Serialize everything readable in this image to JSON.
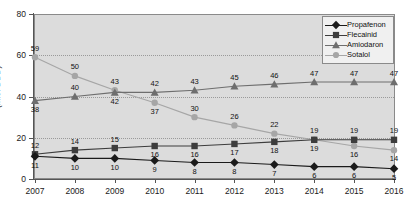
{
  "chart_data": {
    "type": "line",
    "title": "",
    "xlabel": "",
    "ylabel": "(Mio. DDD)",
    "categories": [
      "2007",
      "2008",
      "2009",
      "2010",
      "2011",
      "2012",
      "2013",
      "2014",
      "2015",
      "2016"
    ],
    "ylim": [
      0,
      80
    ],
    "yticks": [
      0,
      20,
      40,
      60,
      80
    ],
    "grid": true,
    "legend_position": "top-right",
    "series": [
      {
        "name": "Propafenon",
        "marker": "diamond",
        "color": "#1a1a1a",
        "values": [
          11,
          10,
          10,
          9,
          8,
          8,
          7,
          6,
          6,
          5
        ],
        "label_side": [
          "below",
          "below",
          "below",
          "below",
          "below",
          "below",
          "below",
          "below",
          "below",
          "below"
        ]
      },
      {
        "name": "Flecainid",
        "marker": "square",
        "color": "#3d3d3d",
        "values": [
          12,
          14,
          15,
          16,
          16,
          17,
          18,
          19,
          19,
          19
        ],
        "label_side": [
          "above",
          "above",
          "above",
          "below",
          "below",
          "below",
          "below",
          "above",
          "above",
          "above"
        ]
      },
      {
        "name": "Amiodaron",
        "marker": "triangle",
        "color": "#6e6e6e",
        "values": [
          38,
          40,
          42,
          42,
          43,
          45,
          46,
          47,
          47,
          47
        ],
        "label_side": [
          "below",
          "above",
          "below",
          "above",
          "above",
          "above",
          "above",
          "above",
          "above",
          "above"
        ]
      },
      {
        "name": "Sotalol",
        "marker": "circle",
        "color": "#a6a6a6",
        "values": [
          59,
          50,
          43,
          37,
          30,
          26,
          22,
          19,
          16,
          14
        ],
        "label_side": [
          "above",
          "above",
          "above",
          "below",
          "above",
          "above",
          "above",
          "below",
          "below",
          "below"
        ]
      }
    ]
  },
  "legend": {
    "items": [
      {
        "label": "Propafenon"
      },
      {
        "label": "Flecainid"
      },
      {
        "label": "Amiodaron"
      },
      {
        "label": "Sotalol"
      }
    ]
  },
  "axis": {
    "y_title": "(Mio. DDD)"
  },
  "colors": {
    "plot_background": "#dcdcdc",
    "frame": "#8a8a8a",
    "grid": "#9a9a9a",
    "page_background": "#ffffff"
  }
}
